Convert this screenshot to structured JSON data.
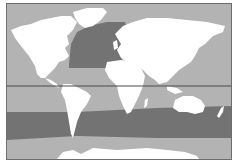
{
  "map": {
    "type": "world-map",
    "projection": "equirectangular-like",
    "colors": {
      "ocean": "#b3b3b3",
      "highlight_region": "#737373",
      "land": "#ffffff",
      "equator_line": "#4a4a4a",
      "frame": "#6e6e6e"
    },
    "regions": [
      {
        "name": "North Atlantic",
        "shade": "dark"
      },
      {
        "name": "Southern Ocean band",
        "shade": "dark"
      }
    ],
    "lines": [
      {
        "name": "equator",
        "style": "solid"
      }
    ]
  }
}
